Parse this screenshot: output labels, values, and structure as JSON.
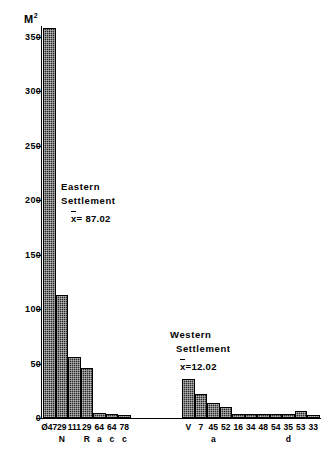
{
  "chart_data": {
    "type": "bar",
    "title": "",
    "subtitle": "",
    "xlabel": "",
    "ylabel": "M²",
    "ylim": [
      0,
      360
    ],
    "yticks": [
      0,
      50,
      100,
      150,
      200,
      250,
      300,
      350
    ],
    "grid": false,
    "legend": "none",
    "groups": [
      {
        "name": "Eastern Settlement",
        "mean_label": "x̄ = 87.02",
        "mean_value": 87.02,
        "categories": [
          "Ø47",
          "29N",
          "111",
          "29R",
          "64a",
          "64c",
          "78c"
        ],
        "category_numbers": [
          "Ø47",
          "29",
          "111",
          "29",
          "64",
          "64",
          "78"
        ],
        "category_subs": [
          "",
          "N",
          "",
          "R",
          "a",
          "c",
          "c"
        ],
        "values": [
          358,
          113,
          56,
          46,
          5,
          4,
          3
        ]
      },
      {
        "name": "Western Settlement",
        "mean_label": "x̄ = 12.02",
        "mean_value": 12.02,
        "categories": [
          "V",
          "7",
          "45a",
          "52",
          "16",
          "34",
          "48",
          "54",
          "35d",
          "53",
          "33"
        ],
        "category_numbers": [
          "V",
          "7",
          "45",
          "52",
          "16",
          "34",
          "48",
          "54",
          "35",
          "53",
          "33"
        ],
        "category_subs": [
          "",
          "",
          "a",
          "",
          "",
          "",
          "",
          "",
          "d",
          "",
          ""
        ],
        "values": [
          36,
          22,
          14,
          10,
          4,
          4,
          4,
          4,
          4,
          6,
          3
        ]
      }
    ],
    "colors": {
      "bar_fill": "#2b2b2b",
      "bar_edge": "#000000",
      "axis": "#000000",
      "background": "#ffffff"
    }
  },
  "axis": {
    "unit_main": "M",
    "unit_exponent": "2",
    "tick_labels": [
      "350",
      "300",
      "250",
      "200",
      "150",
      "100",
      "50",
      "0"
    ]
  },
  "annotations": {
    "eastern": {
      "line1": "Eastern",
      "line2": "Settlement",
      "mean_symbol": "x",
      "mean_text": "= 87.02"
    },
    "western": {
      "line1": "Western",
      "line2": "Settlement",
      "mean_symbol": "x",
      "mean_text": "=12.02"
    }
  }
}
